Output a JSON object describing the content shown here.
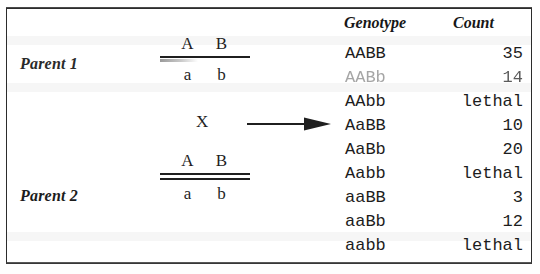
{
  "figure": {
    "background_color": "#ffffff",
    "border_color": "#2b2b2b",
    "text_color": "#1d1d1d"
  },
  "cross": {
    "cross_symbol": "X",
    "arrow": "right-arrow",
    "parents": [
      {
        "label": "Parent 1",
        "top_alleles": [
          "A",
          "B"
        ],
        "bottom_alleles": [
          "a",
          "b"
        ],
        "bar_style": "single"
      },
      {
        "label": "Parent 2",
        "top_alleles": [
          "A",
          "B"
        ],
        "bottom_alleles": [
          "a",
          "b"
        ],
        "bar_style": "double"
      }
    ]
  },
  "table": {
    "headers": {
      "genotype": "Genotype",
      "count": "Count"
    },
    "rows": [
      {
        "genotype": "AABB",
        "count": "35",
        "faded": false
      },
      {
        "genotype": "AABb",
        "count": "14",
        "faded": true
      },
      {
        "genotype": "AAbb",
        "count": "lethal",
        "faded": false
      },
      {
        "genotype": "AaBB",
        "count": "10",
        "faded": false
      },
      {
        "genotype": "AaBb",
        "count": "20",
        "faded": false
      },
      {
        "genotype": "Aabb",
        "count": "lethal",
        "faded": false
      },
      {
        "genotype": "aaBB",
        "count": "3",
        "faded": false
      },
      {
        "genotype": "aaBb",
        "count": "12",
        "faded": false
      },
      {
        "genotype": "aabb",
        "count": "lethal",
        "faded": false
      }
    ]
  },
  "chart_data": {
    "type": "table",
    "columns": [
      "Genotype",
      "Count"
    ],
    "categories": [
      "AABB",
      "AABb",
      "AAbb",
      "AaBB",
      "AaBb",
      "Aabb",
      "aaBB",
      "aaBb",
      "aabb"
    ],
    "values": [
      35,
      14,
      "lethal",
      10,
      20,
      "lethal",
      3,
      12,
      "lethal"
    ],
    "xlabel": "Genotype",
    "ylabel": "Count"
  }
}
